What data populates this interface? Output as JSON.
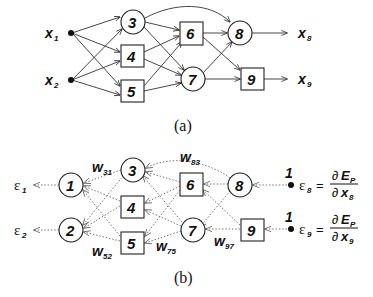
{
  "panel_a": {
    "caption": "(a)",
    "inputs": [
      {
        "id": "x1",
        "label": "x",
        "sub": "1"
      },
      {
        "id": "x2",
        "label": "x",
        "sub": "2"
      }
    ],
    "nodes": [
      {
        "id": "3",
        "label": "3",
        "shape": "circle"
      },
      {
        "id": "4",
        "label": "4",
        "shape": "box"
      },
      {
        "id": "5",
        "label": "5",
        "shape": "box"
      },
      {
        "id": "6",
        "label": "6",
        "shape": "box"
      },
      {
        "id": "7",
        "label": "7",
        "shape": "circle"
      },
      {
        "id": "8",
        "label": "8",
        "shape": "circle"
      },
      {
        "id": "9",
        "label": "9",
        "shape": "box"
      }
    ],
    "outputs": [
      {
        "id": "x8",
        "label": "x",
        "sub": "8"
      },
      {
        "id": "x9",
        "label": "x",
        "sub": "9"
      }
    ],
    "edges": [
      [
        "x1",
        "3"
      ],
      [
        "x1",
        "4"
      ],
      [
        "x1",
        "5"
      ],
      [
        "x2",
        "3"
      ],
      [
        "x2",
        "4"
      ],
      [
        "x2",
        "5"
      ],
      [
        "3",
        "6"
      ],
      [
        "3",
        "7"
      ],
      [
        "3",
        "8"
      ],
      [
        "4",
        "6"
      ],
      [
        "4",
        "7"
      ],
      [
        "5",
        "6"
      ],
      [
        "5",
        "7"
      ],
      [
        "6",
        "8"
      ],
      [
        "6",
        "9"
      ],
      [
        "7",
        "8"
      ],
      [
        "7",
        "9"
      ]
    ]
  },
  "panel_b": {
    "caption": "(b)",
    "nodes": [
      {
        "id": "1",
        "label": "1",
        "shape": "circle"
      },
      {
        "id": "2",
        "label": "2",
        "shape": "circle"
      },
      {
        "id": "3",
        "label": "3",
        "shape": "circle"
      },
      {
        "id": "4",
        "label": "4",
        "shape": "box"
      },
      {
        "id": "5",
        "label": "5",
        "shape": "box"
      },
      {
        "id": "6",
        "label": "6",
        "shape": "box"
      },
      {
        "id": "7",
        "label": "7",
        "shape": "circle"
      },
      {
        "id": "8",
        "label": "8",
        "shape": "circle"
      },
      {
        "id": "9",
        "label": "9",
        "shape": "box"
      }
    ],
    "errors_out": [
      {
        "label": "ε",
        "sub": "1"
      },
      {
        "label": "ε",
        "sub": "2"
      }
    ],
    "weights": [
      {
        "label": "w",
        "sub": "31"
      },
      {
        "label": "w",
        "sub": "52"
      },
      {
        "label": "w",
        "sub": "75"
      },
      {
        "label": "w",
        "sub": "83"
      },
      {
        "label": "w",
        "sub": "97"
      }
    ],
    "seeds": [
      {
        "one": "1",
        "eps": "ε",
        "sub": "8",
        "eq": "=",
        "num": "∂",
        "num_E": "E",
        "num_sub": "P",
        "den": "∂",
        "den_x": "x",
        "den_sub": "8"
      },
      {
        "one": "1",
        "eps": "ε",
        "sub": "9",
        "eq": "=",
        "num": "∂",
        "num_E": "E",
        "num_sub": "P",
        "den": "∂",
        "den_x": "x",
        "den_sub": "9"
      }
    ]
  }
}
